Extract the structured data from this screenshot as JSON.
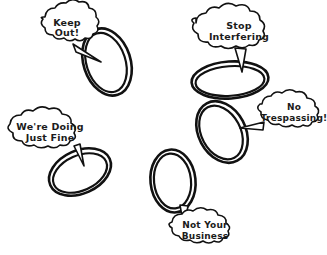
{
  "scene": {
    "title": "Cartoon of five speech bubbles with hand-drawn oval rings",
    "background_color": "#ffffff",
    "ink_color": "#111111",
    "text_color": "#1b1b1b"
  },
  "bubbles": [
    {
      "id": "keep-out",
      "lines": [
        "Keep",
        "Out!"
      ],
      "line1": "Keep",
      "line2": "Out!"
    },
    {
      "id": "stop-interfering",
      "lines": [
        "Stop",
        "Interfering"
      ],
      "line1": "Stop",
      "line2": "Interfering"
    },
    {
      "id": "no-trespassing",
      "lines": [
        "No",
        "Trespassing!"
      ],
      "line1": "No",
      "line2": "Trespassing!"
    },
    {
      "id": "were-doing-just-fine",
      "lines": [
        "We're Doing",
        "Just Fine"
      ],
      "line1": "We're Doing",
      "line2": "Just Fine"
    },
    {
      "id": "not-your-business",
      "lines": [
        "Not Your",
        "Business"
      ],
      "line1": "Not Your",
      "line2": "Business"
    }
  ],
  "rings": [
    {
      "id": "ring-top-left",
      "cx": 107,
      "cy": 62,
      "rx": 22,
      "ry": 33,
      "rotate": -18
    },
    {
      "id": "ring-middle-right",
      "cx": 230,
      "cy": 80,
      "rx": 37,
      "ry": 17,
      "rotate": -4
    },
    {
      "id": "ring-lower-right",
      "cx": 222,
      "cy": 132,
      "rx": 22,
      "ry": 31,
      "rotate": -28
    },
    {
      "id": "ring-left-middle",
      "cx": 80,
      "cy": 172,
      "rx": 31,
      "ry": 20,
      "rotate": -24
    },
    {
      "id": "ring-bottom-center",
      "cx": 173,
      "cy": 181,
      "rx": 21,
      "ry": 30,
      "rotate": -6
    }
  ]
}
